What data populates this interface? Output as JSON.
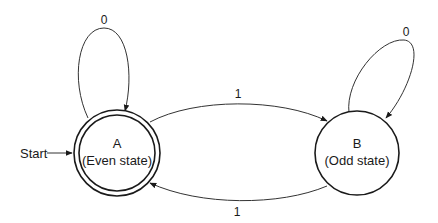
{
  "diagram": {
    "type": "finite-state-machine",
    "start_label": "Start",
    "states": [
      {
        "id": "A",
        "name": "A",
        "description": "(Even state)",
        "accepting": true,
        "initial": true
      },
      {
        "id": "B",
        "name": "B",
        "description": "(Odd state)",
        "accepting": false,
        "initial": false
      }
    ],
    "transitions": [
      {
        "from": "A",
        "to": "A",
        "symbol": "0"
      },
      {
        "from": "A",
        "to": "B",
        "symbol": "1"
      },
      {
        "from": "B",
        "to": "B",
        "symbol": "0"
      },
      {
        "from": "B",
        "to": "A",
        "symbol": "1"
      }
    ],
    "colors": {
      "stroke": "#1a1a1a",
      "background": "#ffffff"
    }
  }
}
